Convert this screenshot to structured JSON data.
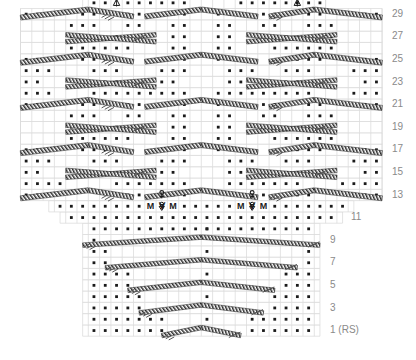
{
  "chart": {
    "type": "knitting-chart",
    "grid": {
      "cell_width": 11.3,
      "cell_height": 11.3,
      "total_columns": 32,
      "total_rows": 31,
      "grid_color": "#d8d8d8",
      "symbol_color": "#1a1a1a",
      "label_color": "#8a8a8a",
      "background": "#ffffff"
    },
    "row_labels": [
      {
        "row": 1,
        "text": "1 (RS)"
      },
      {
        "row": 3,
        "text": "3"
      },
      {
        "row": 5,
        "text": "5"
      },
      {
        "row": 7,
        "text": "7"
      },
      {
        "row": 9,
        "text": "9"
      },
      {
        "row": 11,
        "text": "11"
      },
      {
        "row": 13,
        "text": "13"
      },
      {
        "row": 15,
        "text": "15"
      },
      {
        "row": 17,
        "text": "17"
      },
      {
        "row": 19,
        "text": "19"
      },
      {
        "row": 21,
        "text": "21"
      },
      {
        "row": 23,
        "text": "23"
      },
      {
        "row": 25,
        "text": "25"
      },
      {
        "row": 27,
        "text": "27"
      },
      {
        "row": 29,
        "text": "29"
      }
    ],
    "legend_symbols": [
      {
        "name": "purl-dot",
        "glyph": "•",
        "meaning": "purl stitch"
      },
      {
        "name": "make-one",
        "glyph": "M",
        "meaning": "make one increase"
      },
      {
        "name": "central-decrease",
        "glyph": "∀",
        "meaning": "centered double decrease"
      },
      {
        "name": "bobble",
        "glyph": "♀",
        "meaning": "bobble / nupp"
      },
      {
        "name": "chevron-marker",
        "glyph": "∆",
        "meaning": "chevron peak marker"
      },
      {
        "name": "cable-band",
        "glyph": "╱",
        "meaning": "cable cross travelling stitch"
      }
    ],
    "special_markers": {
      "top_chevrons": [
        "∆",
        "∆"
      ],
      "mid_makeone_groups": [
        "M ∀ M",
        "M ∀ M"
      ],
      "bobbles": [
        "♀",
        "♀",
        "♀",
        "♀"
      ]
    },
    "sections": [
      {
        "name": "upper-panel",
        "rows": "13-30",
        "columns": 32,
        "note": "full width lace-cable repeat"
      },
      {
        "name": "transition",
        "rows": "11-12",
        "columns": 26,
        "note": "increase row with M / central decrease"
      },
      {
        "name": "lower-panel",
        "rows": "1-10",
        "columns": 21,
        "note": "narrow triangular base"
      }
    ]
  }
}
